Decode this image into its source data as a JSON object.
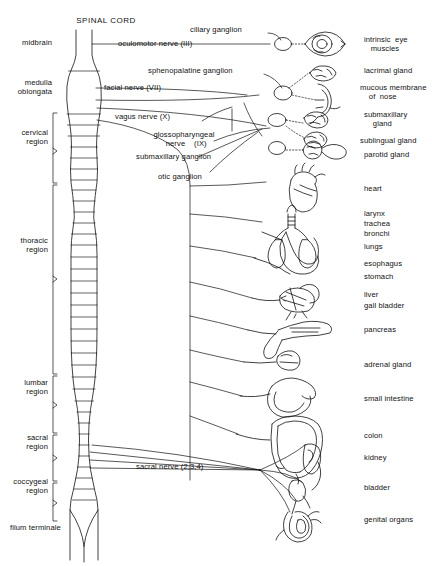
{
  "diagram": {
    "title": "SPINAL CORD",
    "type": "parasympathetic-nervous-system-diagram",
    "ink_color": "#111111",
    "background": "#ffffff"
  },
  "cord_regions": [
    {
      "id": "midbrain",
      "label": "midbrain",
      "bracket": false
    },
    {
      "id": "medulla",
      "label": "medulla\noblongata",
      "bracket": false
    },
    {
      "id": "cervical",
      "label": "cervical\nregion",
      "bracket": true
    },
    {
      "id": "thoracic",
      "label": "thoracic\nregion",
      "bracket": true
    },
    {
      "id": "lumbar",
      "label": "lumbar\nregion",
      "bracket": true
    },
    {
      "id": "sacral",
      "label": "sacral\nregion",
      "bracket": true
    },
    {
      "id": "coccygeal",
      "label": "coccygeal\nregion",
      "bracket": true
    },
    {
      "id": "filum",
      "label": "filum terminale",
      "bracket": false
    }
  ],
  "nerves": [
    {
      "id": "oculomotor",
      "label": "oculomotor nerve (III)"
    },
    {
      "id": "facial",
      "label": "facial nerve (VII)"
    },
    {
      "id": "vagus",
      "label": "vagus nerve (X)"
    },
    {
      "id": "glossopharyngeal",
      "label": "glossopharyngeal\n  nerve    (IX)"
    },
    {
      "id": "sacral-nerve",
      "label": "sacral nerve (2,3,4)"
    }
  ],
  "ganglia": [
    {
      "id": "ciliary",
      "label": "ciliary ganglion"
    },
    {
      "id": "sphenopalatine",
      "label": "sphenopalatine ganglion"
    },
    {
      "id": "submaxillary",
      "label": "submaxillary ganglion"
    },
    {
      "id": "otic",
      "label": "otic ganglion"
    }
  ],
  "organs": [
    {
      "id": "intrinsic-eye-muscles",
      "label": "intrinsic  eye\n   muscles"
    },
    {
      "id": "lacrimal-gland",
      "label": "lacrimal gland"
    },
    {
      "id": "mucous-membrane-nose",
      "label": "mucous membrane\n    of  nose"
    },
    {
      "id": "submaxillary-gland",
      "label": "submaxillary\n    gland"
    },
    {
      "id": "sublingual-gland",
      "label": "sublingual gland"
    },
    {
      "id": "parotid-gland",
      "label": "parotid gland"
    },
    {
      "id": "heart",
      "label": "heart"
    },
    {
      "id": "larynx",
      "label": "larynx"
    },
    {
      "id": "trachea",
      "label": "trachea"
    },
    {
      "id": "bronchi",
      "label": "bronchi"
    },
    {
      "id": "lungs",
      "label": "lungs"
    },
    {
      "id": "esophagus",
      "label": "esophagus"
    },
    {
      "id": "stomach",
      "label": "stomach"
    },
    {
      "id": "liver",
      "label": "liver"
    },
    {
      "id": "gall-bladder",
      "label": "gall bladder"
    },
    {
      "id": "pancreas",
      "label": "pancreas"
    },
    {
      "id": "adrenal-gland",
      "label": "adrenal gland"
    },
    {
      "id": "small-intestine",
      "label": "small intestine"
    },
    {
      "id": "colon",
      "label": "colon"
    },
    {
      "id": "kidney",
      "label": "kidney"
    },
    {
      "id": "bladder",
      "label": "bladder"
    },
    {
      "id": "genital-organs",
      "label": "genital organs"
    }
  ]
}
